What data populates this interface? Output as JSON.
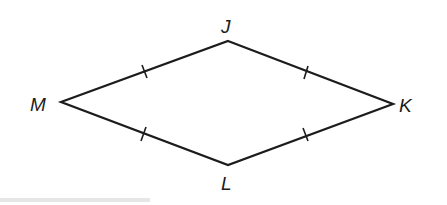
{
  "figure": {
    "shape": "rhombus",
    "vertices": [
      {
        "name": "J",
        "x": 228,
        "y": 41
      },
      {
        "name": "K",
        "x": 393,
        "y": 104
      },
      {
        "name": "L",
        "x": 228,
        "y": 165
      },
      {
        "name": "M",
        "x": 61,
        "y": 102
      }
    ],
    "labels": {
      "J": "J",
      "K": "K",
      "L": "L",
      "M": "M"
    },
    "congruence_marks": [
      "MJ",
      "JK",
      "ML",
      "LK"
    ],
    "line_color": "#1c1c1c"
  }
}
